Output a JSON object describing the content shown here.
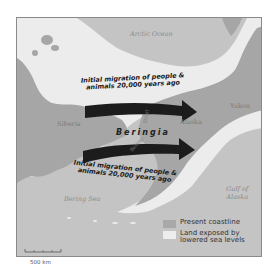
{
  "map": {
    "title_labels": {
      "arctic_ocean": "Arctic Ocean",
      "siberia": "Siberia",
      "alaska": "Alaska",
      "yukon": "Yukon",
      "beringia": "Beringia",
      "bering_strait_top": "Strait",
      "bering_strait_bottom": "Bering",
      "bering_sea": "Bering Sea",
      "gulf_of_alaska_line1": "Gulf of",
      "gulf_of_alaska_line2": "Alaska"
    },
    "arrows": [
      {
        "line1": "Initial migration of people &",
        "line2": "animals 20,000 years ago",
        "position": "north"
      },
      {
        "line1": "Initial migration of people &",
        "line2": "animals 20,000 years ago",
        "position": "south"
      }
    ],
    "legend": {
      "items": [
        {
          "label": "Present coastline",
          "color": "#a9a9a9"
        },
        {
          "label_line1": "Land exposed by",
          "label_line2": "lowered sea levels",
          "color": "#ededed"
        }
      ]
    },
    "scale": {
      "label": "500 km"
    },
    "colors": {
      "ocean": "#c4c4c4",
      "present_land": "#a6a6a6",
      "exposed_land": "#ececec",
      "arrow": "#1c1c1c",
      "frame": "#8a8a8a"
    }
  }
}
